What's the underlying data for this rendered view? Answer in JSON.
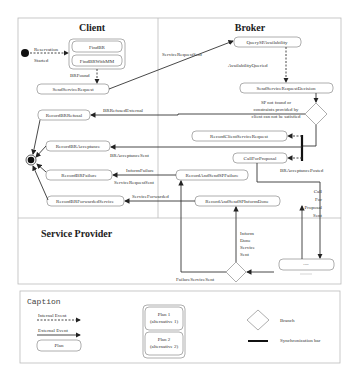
{
  "lanes": {
    "client": "Client",
    "broker": "Broker",
    "service_provider": "Service Provider"
  },
  "nodes": {
    "find_br": "FindBR",
    "find_br_mm": "FindBRWithMM",
    "send_service_request": "SendServiceRequest",
    "record_br_refusal": "RecordBRRefusal",
    "record_br_acceptance": "RecordBRAcceptance",
    "record_br_failure": "RecordBRFailure",
    "record_br_forwarded": "RecordBRForwardedService",
    "query_sp": "QuerySPAvailability",
    "send_service_request_decision": "SendServiceRequestDecision",
    "record_client_service_request": "RecordClientServiceRequest",
    "call_for_proposal": "CallForProposal",
    "record_send_sp_failure": "RecordAndSendSPFailure",
    "record_send_sp_inform": "RecordAndSendSPInformDone",
    "sp_plan": "----"
  },
  "events": {
    "reservation": "Reservation",
    "started": "Started",
    "br_found": "BRFound",
    "service_request_sent": "ServiceRequestSent",
    "availability_queried": "AvailabilityQueried",
    "sp_not_found_1": "SP not found or",
    "sp_not_found_2": "constraints provided by",
    "sp_not_found_3": "client can not be satisfied",
    "br_refused_external": "BRRefusedExternal",
    "br_acceptance_sent": "BRAcceptanceSent",
    "br_acceptance_posted": "BRAcceptancePosted",
    "inform_failure": "InformFailure",
    "service_request_sent_2": "ServiceRequestSent",
    "service_forwarded": "ServiceForwarded",
    "cfp_1": "Call",
    "cfp_2": "For",
    "cfp_3": "Proposal",
    "cfp_4": "Sent",
    "inform_1": "Inform",
    "inform_2": "Done",
    "inform_3": "Service",
    "inform_4": "Sent",
    "failure_service_sent": "FailureServiceSent"
  },
  "caption": {
    "title": "Caption",
    "internal_event": "Internal Event",
    "external_event": "External Event",
    "plan": "Plan",
    "plan1_a": "Plan 1",
    "plan1_b": "(alternative 1)",
    "plan2_a": "Plan 2",
    "plan2_b": "(alternative 2)",
    "branch": "Branch",
    "sync_bar": "Synchronization bar"
  }
}
